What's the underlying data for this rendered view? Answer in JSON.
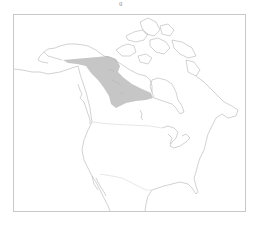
{
  "map": {
    "title_fragment": "g",
    "region": "North America",
    "shaded_range_label": "range",
    "colors": {
      "background": "#ffffff",
      "frame": "#c8c8c8",
      "coastline": "#b4b4b4",
      "border": "#cfcfcf",
      "range_fill": "#c6c6c6"
    }
  }
}
